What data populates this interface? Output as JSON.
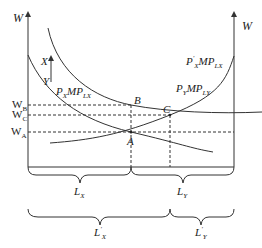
{
  "axes": {
    "left_label": "W",
    "right_label": "W"
  },
  "curves": {
    "px_mplx": {
      "price": "P",
      "price_sub": "X",
      "mp": "MP",
      "mp_sub": "LX"
    },
    "px_prime_mplx": {
      "price": "P",
      "price_sup": "'",
      "price_sub": "X",
      "mp": "MP",
      "mp_sub": "LX"
    },
    "py_mply": {
      "price": "P",
      "price_sub": "Y",
      "mp": "MP",
      "mp_sub": "LY"
    }
  },
  "shift_arrow": {
    "from": "Y",
    "to": "X"
  },
  "wages": {
    "wb": {
      "main": "W",
      "sub": "B"
    },
    "wc": {
      "main": "W",
      "sub": "C"
    },
    "wa": {
      "main": "W",
      "sub": "A"
    }
  },
  "points": {
    "a": "A",
    "b": "B",
    "c": "C"
  },
  "braces": {
    "lx": {
      "main": "L",
      "sub": "X"
    },
    "ly": {
      "main": "L",
      "sub": "Y"
    },
    "lx_prime": {
      "main": "L",
      "sup": "'",
      "sub": "X"
    },
    "ly_prime": {
      "main": "L",
      "sup": "'",
      "sub": "Y"
    }
  },
  "colors": {
    "line": "#333333",
    "background": "#ffffff"
  }
}
